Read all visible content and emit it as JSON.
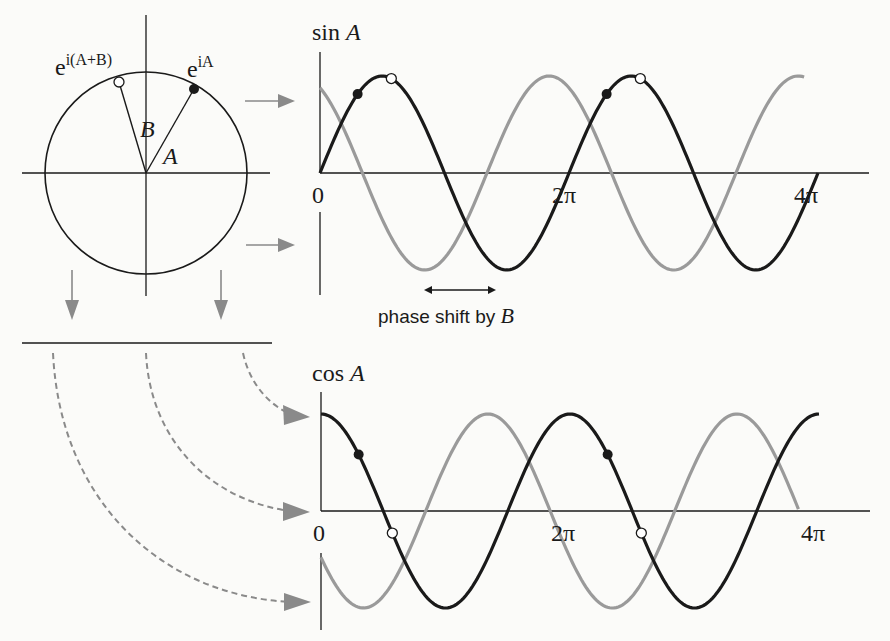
{
  "colors": {
    "background": "#fbfbf9",
    "ink": "#1a1a1a",
    "grey_curve": "#9a9a9a",
    "arrow_grey": "#8a8a8a"
  },
  "circle": {
    "cx": 146,
    "cy": 173,
    "r": 101,
    "point_A_label": "e",
    "point_A_sup": "iA",
    "point_AB_label": "e",
    "point_AB_sup": "i(A+B)",
    "angle_A_label": "A",
    "angle_B_label": "B",
    "angle_A_rad": 1.07,
    "angle_AB_rad": 1.84
  },
  "sin_plot": {
    "title_fn": "sin",
    "title_var": "A",
    "origin_x": 320,
    "axis_y": 173,
    "amp": 97,
    "period_px": 249,
    "tick_labels": [
      "0",
      "2π",
      "4π"
    ],
    "phase_label": "phase shift by",
    "phase_var": "B"
  },
  "cos_plot": {
    "title_fn": "cos",
    "title_var": "A",
    "origin_x": 321,
    "axis_y": 511,
    "amp": 97,
    "period_px": 249,
    "tick_labels": [
      "0",
      "2π",
      "4π"
    ]
  },
  "chart_data": {
    "type": "line",
    "x_ticks": [
      "0",
      "2π",
      "4π"
    ],
    "series": [
      {
        "name": "sin A",
        "style": "black",
        "function": "sin(A)",
        "x_range": [
          0,
          "4π"
        ]
      },
      {
        "name": "sin(A+B)",
        "style": "grey",
        "function": "sin(A+B)",
        "B_rad": 2.07
      },
      {
        "name": "cos A",
        "style": "black",
        "function": "cos(A)",
        "x_range": [
          0,
          "4π"
        ]
      },
      {
        "name": "cos(A+B)",
        "style": "grey",
        "function": "cos(A+B)",
        "B_rad": 2.07
      }
    ],
    "annotation": "phase shift by B"
  }
}
